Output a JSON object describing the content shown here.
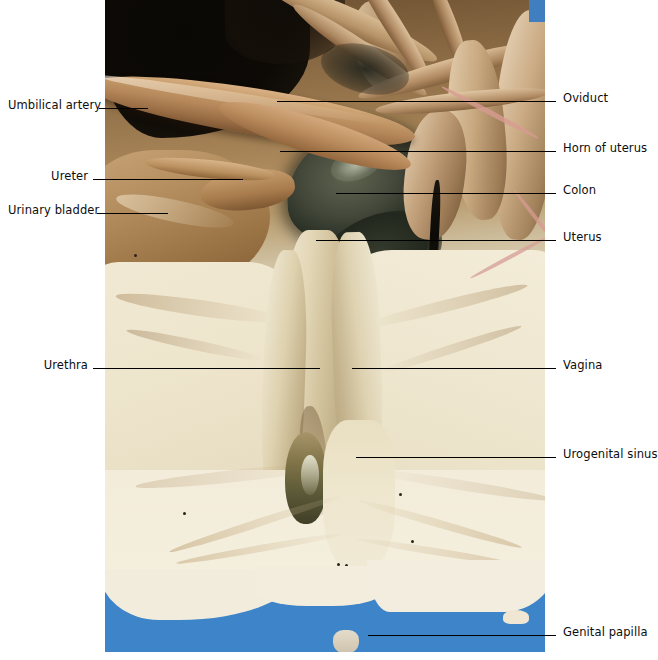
{
  "figure": {
    "kind": "anatomical-photograph",
    "photo": {
      "left_px": 105,
      "top_px": 0,
      "width_px": 440,
      "height_px": 652,
      "background_color": "#3d84c8",
      "tissue_colors": [
        "#0d0a06",
        "#b5875a",
        "#2b3026",
        "#f1ead9",
        "#cfc4b0"
      ]
    }
  },
  "labels_left": [
    {
      "id": "umbilical-artery",
      "text": "Umbilical artery",
      "text_x": 8,
      "text_y": 99,
      "line_x1": 99,
      "line_x2": 148,
      "line_y": 108
    },
    {
      "id": "ureter",
      "text": "Ureter",
      "text_x": 53,
      "text_y": 170,
      "line_x1": 93,
      "line_x2": 243,
      "line_y": 179
    },
    {
      "id": "urinary-bladder",
      "text": "Urinary bladder",
      "text_x": 8,
      "text_y": 204,
      "line_x1": 97,
      "line_x2": 168,
      "line_y": 213
    },
    {
      "id": "urethra",
      "text": "Urethra",
      "text_x": 47,
      "text_y": 359,
      "line_x1": 93,
      "line_x2": 320,
      "line_y": 368
    }
  ],
  "labels_right": [
    {
      "id": "oviduct",
      "text": "Oviduct",
      "text_x": 563,
      "text_y": 92,
      "line_x1": 277,
      "line_x2": 556,
      "line_y": 101
    },
    {
      "id": "horn-of-uterus",
      "text": "Horn of uterus",
      "text_x": 563,
      "text_y": 142,
      "line_x1": 280,
      "line_x2": 556,
      "line_y": 151
    },
    {
      "id": "colon",
      "text": "Colon",
      "text_x": 563,
      "text_y": 184,
      "line_x1": 336,
      "line_x2": 556,
      "line_y": 193
    },
    {
      "id": "uterus",
      "text": "Uterus",
      "text_x": 563,
      "text_y": 231,
      "line_x1": 316,
      "line_x2": 556,
      "line_y": 240
    },
    {
      "id": "vagina",
      "text": "Vagina",
      "text_x": 563,
      "text_y": 359,
      "line_x1": 352,
      "line_x2": 556,
      "line_y": 368
    },
    {
      "id": "urogenital-sinus",
      "text": "Urogenital sinus",
      "text_x": 563,
      "text_y": 448,
      "line_x1": 356,
      "line_x2": 556,
      "line_y": 457
    },
    {
      "id": "genital-papilla",
      "text": "Genital papilla",
      "text_x": 563,
      "text_y": 626,
      "line_x1": 368,
      "line_x2": 556,
      "line_y": 635
    }
  ]
}
